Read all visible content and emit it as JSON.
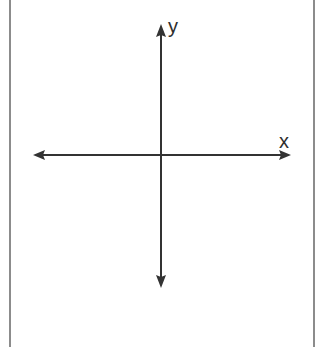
{
  "diagram": {
    "type": "coordinate-plane",
    "axes": {
      "x": {
        "label": "x",
        "arrows": [
          "left",
          "right"
        ]
      },
      "y": {
        "label": "y",
        "arrows": [
          "up",
          "down"
        ]
      }
    },
    "colors": {
      "axis": "#333333",
      "frame": "#8c8c8c",
      "background": "#ffffff"
    }
  }
}
